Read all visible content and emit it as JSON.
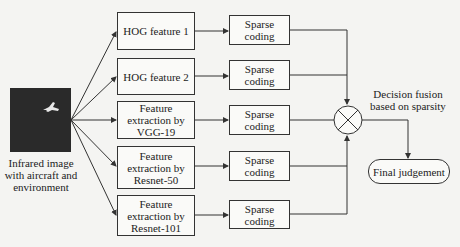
{
  "input": {
    "label_lines": [
      "Infrared image",
      "with aircraft and",
      "environment"
    ],
    "image_bg": "#2a2a2a"
  },
  "branches": [
    {
      "feature_lines": [
        "HOG feature 1"
      ],
      "coding_lines": [
        "Sparse",
        "coding"
      ]
    },
    {
      "feature_lines": [
        "HOG feature 2"
      ],
      "coding_lines": [
        "Sparse",
        "coding"
      ]
    },
    {
      "feature_lines": [
        "Feature",
        "extraction by",
        "VGG-19"
      ],
      "coding_lines": [
        "Sparse",
        "coding"
      ]
    },
    {
      "feature_lines": [
        "Feature",
        "extraction by",
        "Resnet-50"
      ],
      "coding_lines": [
        "Sparse",
        "coding"
      ]
    },
    {
      "feature_lines": [
        "Feature",
        "extraction by",
        "Resnet-101"
      ],
      "coding_lines": [
        "Sparse",
        "coding"
      ]
    }
  ],
  "fusion": {
    "label_lines": [
      "Decision fusion",
      "based on sparsity"
    ],
    "symbol": "circle-times"
  },
  "output": {
    "label": "Final judgement"
  },
  "colors": {
    "line": "#333333",
    "box_bg": "#fafaf8",
    "page_bg": "#f4f4f2"
  }
}
